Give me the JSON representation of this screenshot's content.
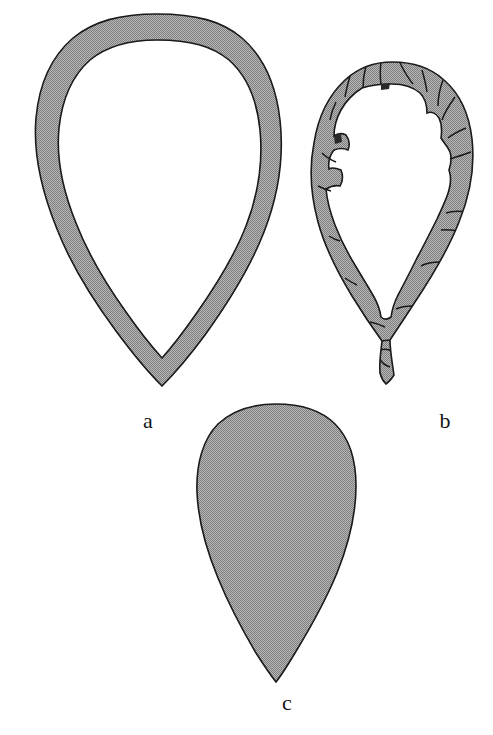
{
  "figure": {
    "background_color": "#ffffff",
    "fill_color": "#9b9b9b",
    "stroke_color": "#1a1a1a",
    "label_color": "#151515",
    "width": 493,
    "height": 735,
    "caption_labels": [
      {
        "id": "a",
        "text": "a",
        "x": 148,
        "y": 424
      },
      {
        "id": "b",
        "text": "b",
        "x": 445,
        "y": 424
      },
      {
        "id": "c",
        "text": "c",
        "x": 287,
        "y": 706
      }
    ],
    "shapes": [
      {
        "id": "a",
        "name": "teardrop-outline-ring",
        "description": "Large teardrop / ovoid ring, hollow centre, smooth continuous band",
        "bbox": {
          "x": 33,
          "y": 14,
          "width": 250,
          "height": 372
        },
        "band_width_px": 25,
        "apex": "bottom"
      },
      {
        "id": "b",
        "name": "teardrop-segmented-ring",
        "description": "Smaller teardrop ring divided into fractured segments with irregular inner margin",
        "bbox": {
          "x": 318,
          "y": 62,
          "width": 156,
          "height": 322
        },
        "band_width_px": 20,
        "segment_count": 12,
        "apex": "bottom"
      },
      {
        "id": "c",
        "name": "teardrop-solid",
        "description": "Solid filled teardrop, rounded top, pointed bottom apex",
        "bbox": {
          "x": 196,
          "y": 404,
          "width": 160,
          "height": 278
        },
        "apex": "bottom"
      }
    ]
  }
}
